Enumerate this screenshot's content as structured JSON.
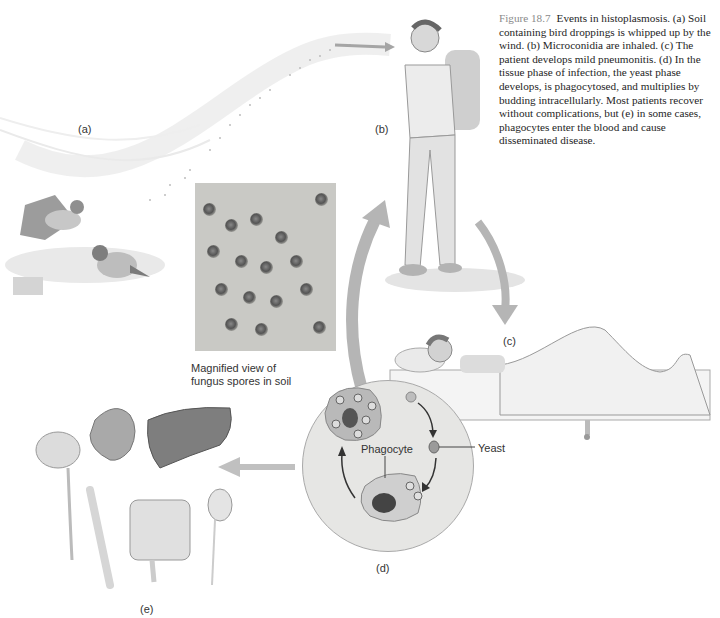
{
  "figure": {
    "number": "Figure 18.7",
    "caption": "Events in histoplasmosis. (a) Soil containing bird droppings is whipped up by the wind. (b) Microconidia are inhaled. (c) The patient develops mild pneumonitis. (d) In the tissue phase of infection, the yeast phase develops, is phagocytosed, and multiplies by budding intracellularly. Most patients recover without complications, but (e) in some cases, phagocytes enter the blood and cause disseminated disease."
  },
  "panels": {
    "a": {
      "label": "(a)",
      "depicts": "two birds on soil, dust whipped up by wind"
    },
    "b": {
      "label": "(b)",
      "depicts": "hiker with backpack inhaling spores"
    },
    "c": {
      "label": "(c)",
      "depicts": "patient lying in bed"
    },
    "d": {
      "label": "(d)",
      "depicts": "tissue phase: yeast phagocytosed and budding"
    },
    "e": {
      "label": "(e)",
      "depicts": "disseminated disease organs: brain, heart, liver, bone, intestine, kidney"
    }
  },
  "photo": {
    "caption_line1": "Magnified view of",
    "caption_line2": "fungus spores in soil"
  },
  "cycle": {
    "yeast_label": "Yeast",
    "phagocyte_label": "Phagocyte"
  }
}
